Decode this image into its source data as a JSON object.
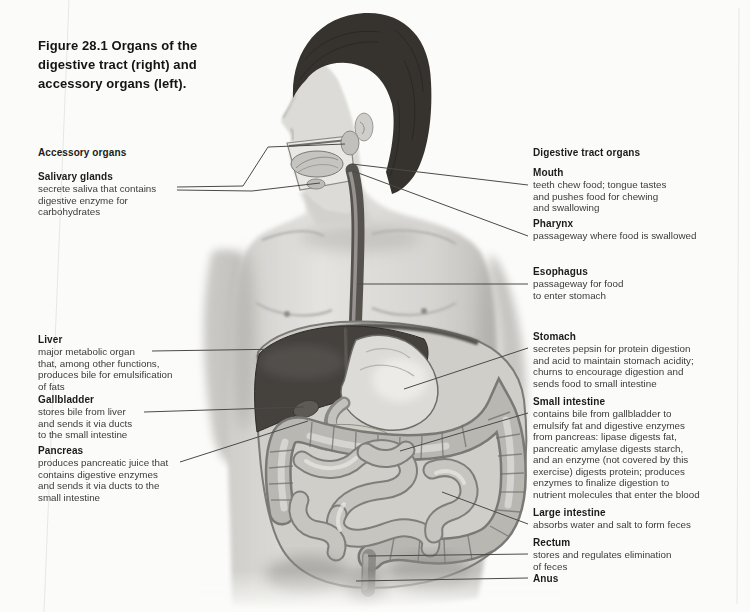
{
  "title": {
    "text": "Figure 28.1   Organs of the\ndigestive tract (right) and\naccessory organs (left)."
  },
  "left": {
    "heading": "Accessory organs",
    "labels": [
      {
        "name": "Salivary glands",
        "desc": "secrete saliva that contains\ndigestive enzyme for\ncarbohydrates"
      },
      {
        "name": "Liver",
        "desc": "major metabolic organ\nthat, among other functions,\nproduces bile for emulsification\nof fats"
      },
      {
        "name": "Gallbladder",
        "desc": "stores bile from liver\nand sends it via ducts\nto the small intestine"
      },
      {
        "name": "Pancreas",
        "desc": "produces pancreatic juice that\ncontains digestive enzymes\nand sends it via ducts to the\nsmall intestine"
      }
    ]
  },
  "right": {
    "heading": "Digestive tract organs",
    "labels": [
      {
        "name": "Mouth",
        "desc": "teeth chew food; tongue tastes\nand pushes food for chewing\nand swallowing"
      },
      {
        "name": "Pharynx",
        "desc": "passageway where food is swallowed"
      },
      {
        "name": "Esophagus",
        "desc": "passageway for food\nto enter stomach"
      },
      {
        "name": "Stomach",
        "desc": "secretes pepsin for protein digestion\nand acid to maintain stomach acidity;\nchurns to encourage digestion and\nsends food to small intestine"
      },
      {
        "name": "Small intestine",
        "desc": "contains bile from gallbladder to\nemulsify fat and digestive enzymes\nfrom pancreas: lipase digests fat,\npancreatic amylase digests starch,\nand an enzyme (not covered by this\nexercise) digests protein; produces\nenzymes to finalize digestion to\nnutrient molecules that enter the blood"
      },
      {
        "name": "Large intestine",
        "desc": "absorbs water and salt to form feces"
      },
      {
        "name": "Rectum",
        "desc": "stores and regulates elimination\nof feces"
      },
      {
        "name": "Anus",
        "desc": ""
      }
    ]
  },
  "artwork_colors": {
    "page_background": "#fbfbf9",
    "skin": "#d9d8d5",
    "hair": "#36322e",
    "liver": "#45423e",
    "stomach": "#dcdbd7",
    "intestine": "#c7c5c0",
    "leader_line": "#4b4a48"
  }
}
